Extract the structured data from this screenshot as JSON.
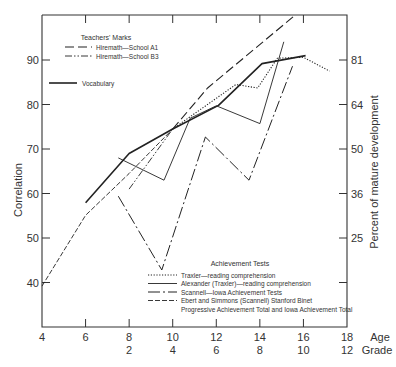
{
  "chart_data": {
    "type": "line",
    "title": "",
    "xlabel": "Age / Grade",
    "ylabel": "Correlation",
    "ylabel_right": "Percent of mature development",
    "xlim": [
      4,
      18
    ],
    "ylim": [
      30,
      100
    ],
    "grid": false,
    "x_ticks_age": [
      "4",
      "6",
      "8",
      "10",
      "12",
      "14",
      "16",
      "18"
    ],
    "x_ticks_grade": [
      "",
      "",
      "2",
      "4",
      "6",
      "8",
      "10",
      "12"
    ],
    "x_axis_suffix_age": "Age",
    "x_axis_suffix_grade": "Grade",
    "y_ticks": [
      "40",
      "50",
      "60",
      "70",
      "80",
      "90"
    ],
    "y_ticks_right": [
      {
        "at": 90,
        "label": "81"
      },
      {
        "at": 80,
        "label": "64"
      },
      {
        "at": 70,
        "label": "50"
      },
      {
        "at": 60,
        "label": "36"
      },
      {
        "at": 50,
        "label": "25"
      },
      {
        "at": 40,
        "label": ""
      }
    ],
    "legend_groups": [
      {
        "heading": "Teachers' Marks",
        "position": "top-left",
        "entries": [
          "Hiremath—School A1",
          "Hiremath—School B3"
        ]
      },
      {
        "heading": "",
        "position": "top-left",
        "entries": [
          "Vocabulary"
        ]
      },
      {
        "heading": "Achievement Tests",
        "position": "bottom-right",
        "entries": [
          "Traxler—reading comprehension",
          "Alexander (Traxler)—reading comprehension",
          "Scannell—Iowa Achievement Tests",
          "Ebert and Simmons (Scannell) Stanford Binet",
          "Progressive Achievement Total and Iowa Achievement Total"
        ]
      }
    ],
    "series": [
      {
        "name": "Hiremath—School A1",
        "style": "longdash",
        "x": [
          10.0,
          11.6,
          15.6
        ],
        "y": [
          74.5,
          83.7,
          100.0
        ]
      },
      {
        "name": "Hiremath—School B3",
        "style": "dashdotdot",
        "x": [
          8.0,
          10.0
        ],
        "y": [
          61.0,
          74.5
        ]
      },
      {
        "name": "Vocabulary",
        "style": "solid-thick",
        "x": [
          6.0,
          8.0,
          10.0,
          12.1,
          14.1,
          16.1
        ],
        "y": [
          57.9,
          69.0,
          74.5,
          79.8,
          89.2,
          91.0
        ]
      },
      {
        "name": "Traxler—reading comprehension",
        "style": "dotted",
        "x": [
          10.0,
          12.9,
          13.9,
          14.8,
          16.0,
          17.2
        ],
        "y": [
          74.5,
          84.5,
          83.7,
          90.4,
          90.6,
          87.5
        ]
      },
      {
        "name": "Alexander (Traxler)—reading comprehension",
        "style": "solid-thin",
        "x": [
          7.5,
          9.6,
          10.8,
          12.0,
          14.0,
          15.1
        ],
        "y": [
          68.0,
          63.0,
          76.9,
          79.7,
          75.7,
          94.1
        ]
      },
      {
        "name": "Scannell—Iowa Achievement Tests",
        "style": "dashdot",
        "x": [
          7.5,
          9.5,
          11.5,
          13.5,
          15.5
        ],
        "y": [
          59.4,
          42.8,
          72.7,
          63.0,
          88.6
        ]
      },
      {
        "name": "Ebert and Simmons (Scannell) Stanford Binet / Progressive Achievement Total and Iowa Achievement Total",
        "style": "dashed",
        "x": [
          4.0,
          6.0,
          8.0,
          10.0
        ],
        "y": [
          39.2,
          55.1,
          64.5,
          74.5
        ]
      }
    ]
  },
  "colors": {
    "line": "#222222",
    "axis": "#333333",
    "background": "#ffffff"
  }
}
